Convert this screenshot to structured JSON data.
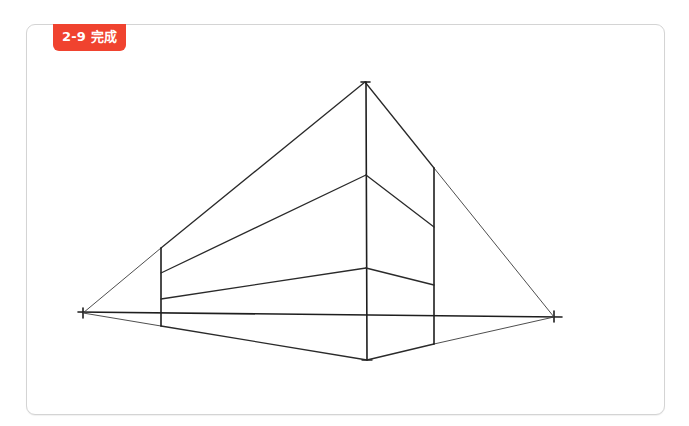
{
  "figure": {
    "label": "2-9 完成",
    "label_color": "#f0432f",
    "frame_border_color": "#d4d4d4",
    "stroke_color": "#2a2a2a"
  },
  "drawing": {
    "title": "Two-point perspective box (completed)",
    "horizon_line": {
      "x1": 78,
      "y1": 312,
      "x2": 562,
      "y2": 317
    },
    "vanishing_points": [
      {
        "name": "left-vp",
        "x": 83,
        "y": 313
      },
      {
        "name": "right-vp",
        "x": 554,
        "y": 317
      }
    ],
    "apex_top": {
      "x": 365,
      "y": 82
    },
    "apex_bottom": {
      "x": 367,
      "y": 360
    },
    "verticals": [
      {
        "name": "left-edge",
        "x": 161,
        "y1": 248,
        "y2": 326
      },
      {
        "name": "center-edge",
        "x": 366,
        "y1": 82,
        "y2": 360
      },
      {
        "name": "right-edge",
        "x": 434,
        "y1": 168,
        "y2": 344
      }
    ],
    "interior_points": [
      {
        "name": "center-upper",
        "x": 366,
        "y": 175
      },
      {
        "name": "center-lower",
        "x": 366,
        "y": 268
      },
      {
        "name": "left-upper",
        "x": 161,
        "y": 273
      },
      {
        "name": "left-lower",
        "x": 161,
        "y": 299
      },
      {
        "name": "right-upper",
        "x": 434,
        "y": 227
      },
      {
        "name": "right-lower",
        "x": 434,
        "y": 285
      }
    ]
  }
}
